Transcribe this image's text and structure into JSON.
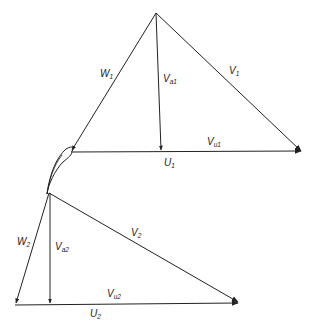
{
  "diagram": {
    "colors": {
      "stroke": "#222222",
      "background": "#ffffff"
    },
    "inlet_triangle": {
      "labels": {
        "W": {
          "base": "W",
          "sub": "1"
        },
        "V": {
          "base": "V",
          "sub": "1"
        },
        "Va": {
          "base": "V",
          "sub": "a1"
        },
        "Vu": {
          "base": "V",
          "sub": "u1"
        },
        "U": {
          "base": "U",
          "sub": "1"
        }
      }
    },
    "outlet_triangle": {
      "labels": {
        "W": {
          "base": "W",
          "sub": "2"
        },
        "V": {
          "base": "V",
          "sub": "2"
        },
        "Va": {
          "base": "V",
          "sub": "a2"
        },
        "Vu": {
          "base": "V",
          "sub": "u2"
        },
        "U": {
          "base": "U",
          "sub": "2"
        }
      }
    },
    "blade": {
      "name": "rotor blade profile"
    }
  }
}
